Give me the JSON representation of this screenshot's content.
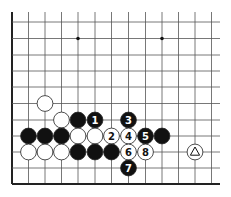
{
  "diagram": {
    "type": "go-board-fragment",
    "grid": {
      "left_edge_x": 12,
      "bottom_edge_y": 184,
      "col_x": [
        12,
        28.5,
        45,
        61.5,
        78,
        95,
        111.5,
        128.5,
        145.5,
        162,
        178.5,
        195,
        211.5
      ],
      "row_y": [
        22,
        38.5,
        55,
        71,
        87,
        103.5,
        120,
        136,
        152,
        168,
        184
      ],
      "right_extent": 220,
      "top_extent": 12
    },
    "star_points": [
      {
        "col": 4,
        "row": 1
      },
      {
        "col": 9,
        "row": 1
      }
    ],
    "stones": [
      {
        "color": "white",
        "col": 2,
        "row": 5,
        "label": ""
      },
      {
        "color": "white",
        "col": 3,
        "row": 6,
        "label": ""
      },
      {
        "color": "black",
        "col": 4,
        "row": 6,
        "label": ""
      },
      {
        "color": "black",
        "col": 5,
        "row": 6,
        "label": "1"
      },
      {
        "color": "black",
        "col": 7,
        "row": 6,
        "label": "3"
      },
      {
        "color": "black",
        "col": 1,
        "row": 7,
        "label": ""
      },
      {
        "color": "black",
        "col": 2,
        "row": 7,
        "label": ""
      },
      {
        "color": "black",
        "col": 3,
        "row": 7,
        "label": ""
      },
      {
        "color": "white",
        "col": 4,
        "row": 7,
        "label": ""
      },
      {
        "color": "white",
        "col": 5,
        "row": 7,
        "label": ""
      },
      {
        "color": "white",
        "col": 6,
        "row": 7,
        "label": "2"
      },
      {
        "color": "white",
        "col": 7,
        "row": 7,
        "label": "4"
      },
      {
        "color": "black",
        "col": 8,
        "row": 7,
        "label": "5"
      },
      {
        "color": "black",
        "col": 9,
        "row": 7,
        "label": ""
      },
      {
        "color": "white",
        "col": 1,
        "row": 8,
        "label": ""
      },
      {
        "color": "white",
        "col": 2,
        "row": 8,
        "label": ""
      },
      {
        "color": "white",
        "col": 3,
        "row": 8,
        "label": ""
      },
      {
        "color": "black",
        "col": 4,
        "row": 8,
        "label": ""
      },
      {
        "color": "black",
        "col": 5,
        "row": 8,
        "label": ""
      },
      {
        "color": "black",
        "col": 6,
        "row": 8,
        "label": ""
      },
      {
        "color": "white",
        "col": 7,
        "row": 8,
        "label": "6"
      },
      {
        "color": "white",
        "col": 8,
        "row": 8,
        "label": "8"
      },
      {
        "color": "white",
        "col": 11,
        "row": 8,
        "label": "triangle"
      },
      {
        "color": "black",
        "col": 7,
        "row": 9,
        "label": "7"
      }
    ],
    "colors": {
      "line": "#555555",
      "edge": "#222222",
      "black_stone": "#111111",
      "white_stone": "#ffffff",
      "stone_outline": "#222222"
    }
  }
}
